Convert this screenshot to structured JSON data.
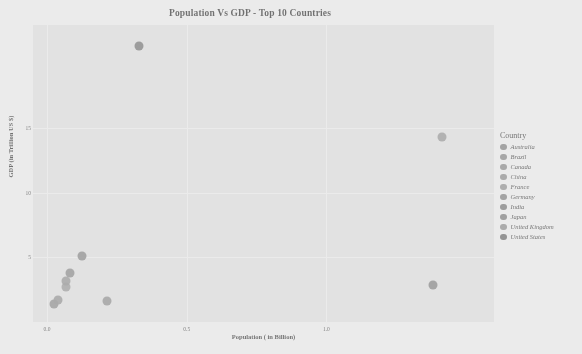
{
  "chart_data": {
    "type": "scatter",
    "title": "Population Vs GDP - Top 10 Countries",
    "xlabel": "Population ( in Billion)",
    "ylabel": "GDP (in Trillion US $)",
    "xlim": [
      -0.05,
      1.6
    ],
    "ylim": [
      0,
      23
    ],
    "xticks": [
      "0.0",
      "0.5",
      "1.0"
    ],
    "xtick_values": [
      0.0,
      0.5,
      1.0
    ],
    "yticks": [
      "5",
      "10",
      "15"
    ],
    "ytick_values": [
      5,
      10,
      15
    ],
    "grid": true,
    "legend_title": "Country",
    "legend_position": "right",
    "points": [
      {
        "country": "Australia",
        "population": 0.026,
        "gdp": 1.4,
        "color": "#7d7d7d"
      },
      {
        "country": "Brazil",
        "population": 0.213,
        "gdp": 1.6,
        "color": "#828282"
      },
      {
        "country": "Canada",
        "population": 0.038,
        "gdp": 1.7,
        "color": "#868686"
      },
      {
        "country": "China",
        "population": 1.412,
        "gdp": 14.3,
        "color": "#8a8a8a"
      },
      {
        "country": "France",
        "population": 0.068,
        "gdp": 2.7,
        "color": "#8e8e8e"
      },
      {
        "country": "Germany",
        "population": 0.084,
        "gdp": 3.8,
        "color": "#7a7a7a"
      },
      {
        "country": "India",
        "population": 1.38,
        "gdp": 2.9,
        "color": "#6f6f6f"
      },
      {
        "country": "Japan",
        "population": 0.126,
        "gdp": 5.1,
        "color": "#757575"
      },
      {
        "country": "United Kingdom",
        "population": 0.068,
        "gdp": 3.2,
        "color": "#898989"
      },
      {
        "country": "United States",
        "population": 0.331,
        "gdp": 21.4,
        "color": "#5f5f5f"
      }
    ]
  },
  "legend": {
    "title": "Country",
    "items": [
      {
        "label": "Australia",
        "color": "#7d7d7d"
      },
      {
        "label": "Brazil",
        "color": "#828282"
      },
      {
        "label": "Canada",
        "color": "#868686"
      },
      {
        "label": "China",
        "color": "#8a8a8a"
      },
      {
        "label": "France",
        "color": "#8e8e8e"
      },
      {
        "label": "Germany",
        "color": "#7a7a7a"
      },
      {
        "label": "India",
        "color": "#6f6f6f"
      },
      {
        "label": "Japan",
        "color": "#757575"
      },
      {
        "label": "United Kingdom",
        "color": "#898989"
      },
      {
        "label": "United States",
        "color": "#5f5f5f"
      }
    ]
  },
  "style": {
    "panel_background": "#ededed",
    "gridline_color": "#ffffff",
    "figure_background": "#ffffff",
    "text_color": "#1d1d1d"
  }
}
